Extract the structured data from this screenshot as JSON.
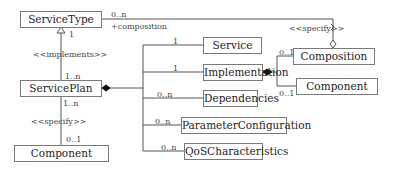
{
  "diagram": {
    "type": "UML class diagram",
    "classes": {
      "service_type": "ServiceType",
      "service_plan": "ServicePlan",
      "component_left": "Component",
      "service": "Service",
      "implementation": "Implementation",
      "dependencies": "Dependencies",
      "parameter_configuration": "ParameterConfiguration",
      "qos_characteristics": "QoSCharacteristics",
      "composition": "Composition",
      "component_right": "Component"
    },
    "labels": {
      "servicetype_to_composition_mult": "0..n",
      "composition_role": "+composition",
      "specify_top": "<<specify>>",
      "servicetype_mult": "1",
      "implements": "<<implements>>",
      "serviceplan_mult_top": "1..n",
      "serviceplan_mult_bottom": "1..n",
      "specify_left": "<<specify>>",
      "component_mult": "0..1",
      "service_mult": "1",
      "implementation_mult": "1",
      "dependencies_mult": "0..n",
      "parameter_mult": "0..n",
      "qos_mult": "0..n",
      "composition_mult": "0..1",
      "component_right_mult": "0..1"
    }
  }
}
